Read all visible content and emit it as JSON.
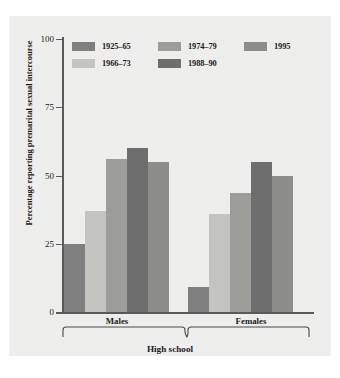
{
  "chart_data": {
    "type": "bar",
    "title": "",
    "xlabel": "High school",
    "ylabel": "Percentage reporting premarital sexual intercourse",
    "ylim": [
      0,
      100
    ],
    "yticks": [
      "0",
      "25",
      "50",
      "75",
      "100"
    ],
    "ytick_values": [
      0,
      25,
      50,
      75,
      100
    ],
    "grid": false,
    "legend_position": "top-inside",
    "categories": [
      "Males",
      "Females"
    ],
    "series": [
      {
        "name": "1925–65",
        "color": "#808080",
        "values": [
          25,
          9
        ]
      },
      {
        "name": "1966–73",
        "color": "#c4c4c0",
        "values": [
          37,
          36
        ]
      },
      {
        "name": "1974–79",
        "color": "#9d9d9a",
        "values": [
          56,
          43.5
        ]
      },
      {
        "name": "1988–90",
        "color": "#6e6e6e",
        "values": [
          60,
          55
        ]
      },
      {
        "name": "1995",
        "color": "#8d8d8a",
        "values": [
          55,
          50
        ]
      }
    ]
  },
  "legend": {
    "rows": [
      [
        {
          "label": "1925–65",
          "color": "#808080"
        },
        {
          "label": "1974–79",
          "color": "#9d9d9a"
        },
        {
          "label": "1995",
          "color": "#8d8d8a"
        }
      ],
      [
        {
          "label": "1966–73",
          "color": "#c4c4c0"
        },
        {
          "label": "1988–90",
          "color": "#6e6e6e"
        }
      ]
    ]
  },
  "axis": {
    "y_title": "Percentage reporting premarital sexual intercourse",
    "tick_100": "100",
    "tick_75": "75",
    "tick_50": "50",
    "tick_25": "25",
    "tick_0": "0"
  },
  "groups": {
    "left": "Males",
    "right": "Females",
    "bracket_label": "High school"
  },
  "colors": {
    "plate_background": "#eeeeec",
    "page_background": "#ffffff",
    "axis": "#5a5a58",
    "text": "#1b1b1b"
  }
}
